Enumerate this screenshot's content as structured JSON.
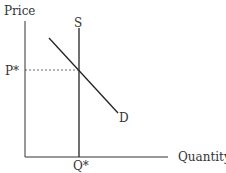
{
  "diagram": {
    "type": "supply-demand",
    "y_axis_label": "Price",
    "x_axis_label": "Quantity",
    "supply_label": "S",
    "demand_label": "D",
    "price_eq_label": "P*",
    "quantity_eq_label": "Q*"
  }
}
